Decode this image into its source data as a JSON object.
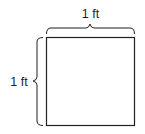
{
  "diagram": {
    "shape": "square",
    "top_label": "1 ft",
    "left_label": "1 ft",
    "colors": {
      "stroke": "#231f20",
      "background": "#ffffff"
    }
  }
}
